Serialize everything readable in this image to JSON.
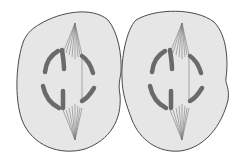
{
  "figure": {
    "description": "Two adjacent cells in mitosis (anaphase) with spindle fibers and separating chromosomes",
    "colors": {
      "background": "#ffffff",
      "cytoplasm": "#e6e6e6",
      "membrane": "#4a4a4a",
      "chromosome": "#6a6a6a",
      "spindle": "#7a7a7a"
    },
    "cells": [
      {
        "name": "left-cell",
        "pole_top": [
          75,
          23
        ],
        "pole_bottom": [
          75,
          140
        ]
      },
      {
        "name": "right-cell",
        "pole_top": [
          182,
          23
        ],
        "pole_bottom": [
          182,
          140
        ]
      }
    ]
  }
}
